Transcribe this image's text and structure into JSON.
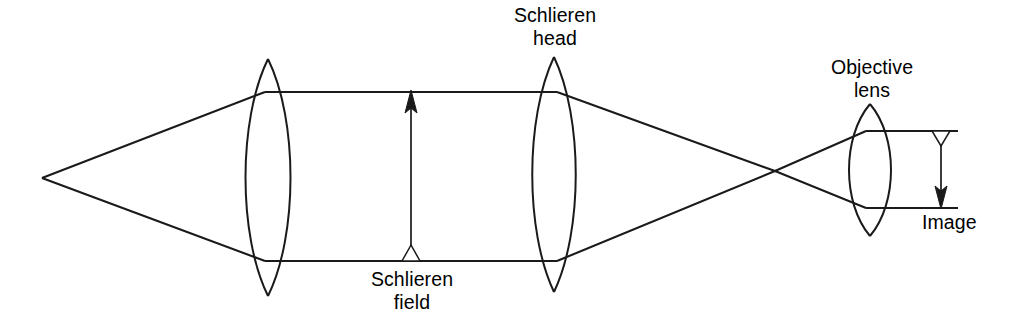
{
  "figure": {
    "type": "optical-ray-diagram",
    "background_color": "#ffffff",
    "line_color": "#1a1a1a",
    "width": 1010,
    "height": 326
  },
  "labels": {
    "schlieren_head": {
      "line1": "Schlieren",
      "line2": "head",
      "x": 555,
      "y": 4
    },
    "schlieren_field": {
      "line1": "Schlieren",
      "line2": "field",
      "x": 412,
      "y": 268
    },
    "objective_lens": {
      "line1": "Objective",
      "line2": "lens",
      "x": 872,
      "y": 56
    },
    "image": {
      "line1": "Image",
      "x": 922,
      "y": 211
    }
  },
  "components": {
    "source_point": {
      "x": 42,
      "y": 178
    },
    "condenser_lens": {
      "name": "condenser-lens",
      "center_x": 268,
      "top_apex_y": 59,
      "bottom_apex_y": 296,
      "half_width": 25
    },
    "schlieren_head_lens": {
      "name": "schlieren-head-lens",
      "center_x": 554,
      "top_apex_y": 57,
      "bottom_apex_y": 292,
      "half_width": 24
    },
    "objective_lens": {
      "name": "objective-lens",
      "center_x": 870,
      "top_apex_y": 104,
      "bottom_apex_y": 236,
      "half_width": 23
    },
    "beam_crossover": {
      "x": 775,
      "y": 171
    }
  },
  "arrows": {
    "schlieren_field_arrow": {
      "direction": "up",
      "x": 411,
      "base_y": 261,
      "tip_y": 92,
      "base_marker": "hollow-triangle",
      "tip_marker": "solid-triangle"
    },
    "image_arrow": {
      "direction": "down",
      "x": 941,
      "base_y": 131,
      "tip_y": 208,
      "base_marker": "hollow-triangle",
      "tip_marker": "solid-triangle"
    }
  },
  "rays": {
    "upper_collimated_y": 92,
    "lower_collimated_y": 261,
    "image_plane_top_y": 131,
    "image_plane_bottom_y": 208,
    "image_plane_right_x": 958
  }
}
